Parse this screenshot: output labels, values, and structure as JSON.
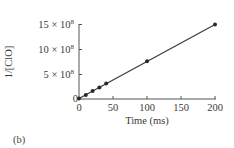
{
  "chart_data": {
    "type": "line",
    "title": "",
    "xlabel": "Time (ms)",
    "ylabel": "1/[ClO]",
    "xlim": [
      0,
      200
    ],
    "ylim": [
      0,
      1500000000
    ],
    "x_ticks": [
      0,
      50,
      100,
      150,
      200
    ],
    "x_tick_labels": [
      "0",
      "50",
      "100",
      "150",
      "200"
    ],
    "y_ticks": [
      0,
      500000000,
      1000000000,
      1500000000
    ],
    "y_tick_labels": [
      "0",
      "5 × 10⁸",
      "10 × 10⁸",
      "15 × 10⁸"
    ],
    "grid": false,
    "legend": null,
    "series": [
      {
        "name": "1/[ClO] vs time",
        "marker": "circle",
        "line": "linear fit",
        "x": [
          0,
          10,
          20,
          30,
          40,
          100,
          200
        ],
        "y": [
          10000000,
          80000000,
          160000000,
          230000000,
          310000000,
          760000000,
          1500000000
        ]
      }
    ],
    "panel_label": "(b)"
  },
  "labels": {
    "xlabel": "Time (ms)",
    "ylabel": "1/[ClO]",
    "panel": "(b)",
    "x_ticks": [
      "0",
      "50",
      "100",
      "150",
      "200"
    ],
    "y_ticks": [
      "0",
      "5 × 10",
      "10 × 10",
      "15 × 10"
    ],
    "y_exp": "8"
  },
  "colors": {
    "axis": "#555555",
    "line": "#3a3a3a",
    "marker": "#2a2a2a"
  }
}
